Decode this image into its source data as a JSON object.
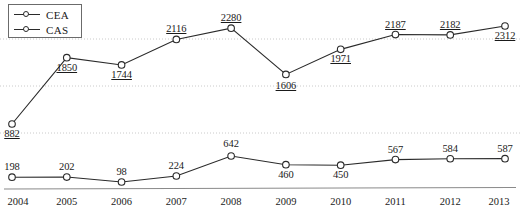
{
  "legend": {
    "position": "top-left",
    "items": [
      {
        "label": "CEA",
        "marker": "circle-open-icon"
      },
      {
        "label": "CAS",
        "marker": "circle-open-icon"
      }
    ]
  },
  "chart_data": {
    "type": "line",
    "title": "",
    "xlabel": "",
    "ylabel": "",
    "grid": true,
    "legend_position": "top-left",
    "categories": [
      "2004",
      "2005",
      "2006",
      "2007",
      "2008",
      "2009",
      "2010",
      "2011",
      "2012",
      "2013"
    ],
    "series": [
      {
        "name": "CEA",
        "label_style": "underlined",
        "values": [
          882,
          1850,
          1744,
          2116,
          2280,
          1606,
          1971,
          2187,
          2182,
          2312
        ]
      },
      {
        "name": "CAS",
        "label_style": "plain",
        "values": [
          198,
          202,
          98,
          224,
          642,
          460,
          450,
          567,
          584,
          587
        ]
      }
    ]
  },
  "style": {
    "line_color": "#2a2a2a",
    "marker_fill": "#ffffff",
    "marker_stroke": "#2a2a2a",
    "grid_color": "#bdbdbd",
    "axis_color": "#8a8a8a",
    "text_color": "#1a1a1a"
  }
}
